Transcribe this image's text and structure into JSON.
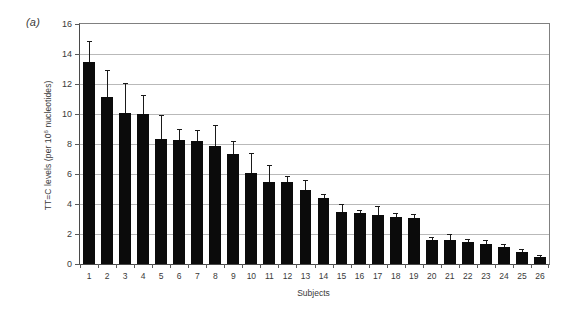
{
  "figure": {
    "panel_label": "(a)",
    "background": "#ffffff"
  },
  "chart_data": {
    "type": "bar",
    "title": "",
    "panel": "(a)",
    "xlabel": "Subjects",
    "ylabel": "TT=C levels (per 10⁶ nucleotides)",
    "ylabel_parts": {
      "pre": "TT=C levels (per 10",
      "sup": "6",
      "post": " nucleotides)"
    },
    "categories": [
      "1",
      "2",
      "3",
      "4",
      "5",
      "6",
      "7",
      "8",
      "9",
      "10",
      "11",
      "12",
      "13",
      "14",
      "15",
      "16",
      "17",
      "18",
      "19",
      "20",
      "21",
      "22",
      "23",
      "24",
      "25",
      "26"
    ],
    "values": [
      13.5,
      11.15,
      10.05,
      10.0,
      8.35,
      8.25,
      8.2,
      7.85,
      7.35,
      6.05,
      5.5,
      5.45,
      4.95,
      4.4,
      3.45,
      3.4,
      3.3,
      3.15,
      3.1,
      1.6,
      1.6,
      1.5,
      1.35,
      1.15,
      0.8,
      0.5
    ],
    "error_upper": [
      1.35,
      1.8,
      2.0,
      1.3,
      1.6,
      0.75,
      0.75,
      1.45,
      0.85,
      1.35,
      1.1,
      0.45,
      0.65,
      0.3,
      0.55,
      0.2,
      0.55,
      0.25,
      0.25,
      0.2,
      0.4,
      0.15,
      0.25,
      0.2,
      0.2,
      0.1
    ],
    "yticks": [
      0,
      2,
      4,
      6,
      8,
      10,
      12,
      14,
      16
    ],
    "ylim": [
      0,
      16
    ],
    "grid": true,
    "grid_axis": "y",
    "legend": null,
    "bar_color": "#0b0b0b",
    "error_bar_color": "#1a1a1a",
    "gridline_color": "#b9b9b9",
    "axis_color": "#4a4a4a"
  }
}
